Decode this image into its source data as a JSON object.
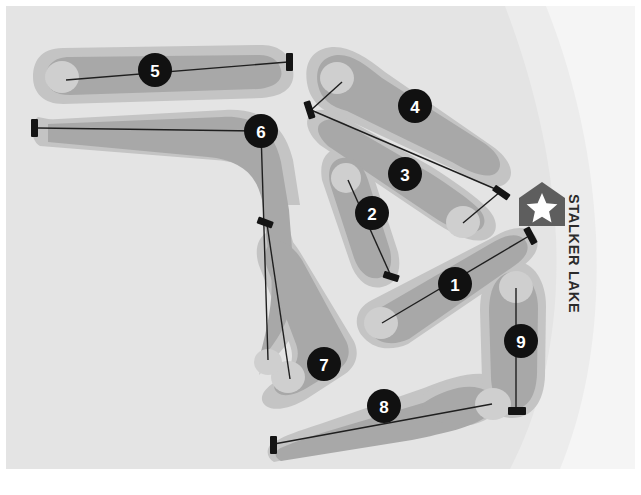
{
  "map": {
    "title": "Golf Course Layout Map",
    "width": 641,
    "height": 495,
    "labels": {
      "lake": "STALKER LAKE"
    },
    "colors": {
      "page_background": "#ffffff",
      "terrain_background": "#e4e4e4",
      "rough": "#c4c4c4",
      "fairway": "#a8a8a8",
      "green": "#cfcfcf",
      "water": "#f4f4f4",
      "tee_marker": "#141414",
      "play_line": "#1f1f1f",
      "badge_fill": "#111111",
      "badge_text": "#ffffff",
      "clubhouse_fill": "#5e5e5e",
      "clubhouse_star": "#ffffff",
      "label_text": "#2b2b2b"
    },
    "clubhouse": {
      "name": "clubhouse",
      "icon": "star-marker",
      "x": 542,
      "y": 205
    },
    "holes": [
      {
        "number": "1",
        "badge_x": 455,
        "badge_y": 284
      },
      {
        "number": "2",
        "badge_x": 372,
        "badge_y": 213
      },
      {
        "number": "3",
        "badge_x": 405,
        "badge_y": 174
      },
      {
        "number": "4",
        "badge_x": 415,
        "badge_y": 106
      },
      {
        "number": "5",
        "badge_x": 155,
        "badge_y": 70
      },
      {
        "number": "6",
        "badge_x": 261,
        "badge_y": 131
      },
      {
        "number": "7",
        "badge_x": 324,
        "badge_y": 364
      },
      {
        "number": "8",
        "badge_x": 384,
        "badge_y": 406
      },
      {
        "number": "9",
        "badge_x": 521,
        "badge_y": 341
      }
    ],
    "tees": [
      {
        "hole": "5",
        "x": 290,
        "y": 61,
        "angle": 0
      },
      {
        "hole": "6",
        "x": 34,
        "y": 127,
        "angle": 0
      },
      {
        "hole": "4",
        "x": 310,
        "y": 110,
        "angle": -20
      },
      {
        "hole": "3",
        "x": 502,
        "y": 193,
        "angle": -35
      },
      {
        "hole": "2",
        "x": 392,
        "y": 277,
        "angle": -8
      },
      {
        "hole": "1",
        "x": 531,
        "y": 235,
        "angle": -30
      },
      {
        "hole": "7",
        "x": 265,
        "y": 221,
        "angle": -10
      },
      {
        "hole": "8",
        "x": 272,
        "y": 444,
        "angle": 0
      },
      {
        "hole": "9",
        "x": 517,
        "y": 411,
        "angle": 0
      }
    ]
  }
}
